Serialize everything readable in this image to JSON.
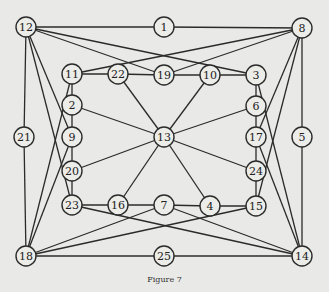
{
  "caption": "Figure 7",
  "nodes": [
    {
      "id": "12",
      "x": 26,
      "y": 27
    },
    {
      "id": "1",
      "x": 164,
      "y": 27
    },
    {
      "id": "8",
      "x": 302,
      "y": 28
    },
    {
      "id": "11",
      "x": 72,
      "y": 74
    },
    {
      "id": "22",
      "x": 118,
      "y": 74
    },
    {
      "id": "19",
      "x": 164,
      "y": 75
    },
    {
      "id": "10",
      "x": 210,
      "y": 75
    },
    {
      "id": "3",
      "x": 256,
      "y": 75
    },
    {
      "id": "2",
      "x": 72,
      "y": 105
    },
    {
      "id": "6",
      "x": 256,
      "y": 106
    },
    {
      "id": "21",
      "x": 24,
      "y": 137
    },
    {
      "id": "9",
      "x": 72,
      "y": 137
    },
    {
      "id": "13",
      "x": 164,
      "y": 137
    },
    {
      "id": "17",
      "x": 256,
      "y": 137
    },
    {
      "id": "5",
      "x": 302,
      "y": 137
    },
    {
      "id": "20",
      "x": 72,
      "y": 171
    },
    {
      "id": "24",
      "x": 256,
      "y": 171
    },
    {
      "id": "23",
      "x": 72,
      "y": 205
    },
    {
      "id": "16",
      "x": 118,
      "y": 205
    },
    {
      "id": "7",
      "x": 164,
      "y": 205
    },
    {
      "id": "4",
      "x": 210,
      "y": 206
    },
    {
      "id": "15",
      "x": 256,
      "y": 206
    },
    {
      "id": "18",
      "x": 26,
      "y": 256
    },
    {
      "id": "25",
      "x": 164,
      "y": 256
    },
    {
      "id": "14",
      "x": 302,
      "y": 256
    }
  ],
  "edges": [
    [
      "12",
      "1"
    ],
    [
      "1",
      "8"
    ],
    [
      "12",
      "21"
    ],
    [
      "21",
      "18"
    ],
    [
      "8",
      "5"
    ],
    [
      "5",
      "14"
    ],
    [
      "18",
      "25"
    ],
    [
      "25",
      "14"
    ],
    [
      "12",
      "3"
    ],
    [
      "12",
      "19"
    ],
    [
      "12",
      "9"
    ],
    [
      "12",
      "23"
    ],
    [
      "8",
      "11"
    ],
    [
      "8",
      "19"
    ],
    [
      "8",
      "17"
    ],
    [
      "8",
      "15"
    ],
    [
      "18",
      "11"
    ],
    [
      "18",
      "9"
    ],
    [
      "18",
      "7"
    ],
    [
      "18",
      "15"
    ],
    [
      "14",
      "3"
    ],
    [
      "14",
      "17"
    ],
    [
      "14",
      "23"
    ],
    [
      "14",
      "7"
    ],
    [
      "11",
      "22"
    ],
    [
      "22",
      "19"
    ],
    [
      "19",
      "10"
    ],
    [
      "10",
      "3"
    ],
    [
      "3",
      "6"
    ],
    [
      "6",
      "17"
    ],
    [
      "17",
      "24"
    ],
    [
      "24",
      "15"
    ],
    [
      "15",
      "4"
    ],
    [
      "4",
      "7"
    ],
    [
      "7",
      "16"
    ],
    [
      "16",
      "23"
    ],
    [
      "23",
      "20"
    ],
    [
      "20",
      "9"
    ],
    [
      "9",
      "2"
    ],
    [
      "2",
      "11"
    ],
    [
      "13",
      "22"
    ],
    [
      "13",
      "10"
    ],
    [
      "13",
      "6"
    ],
    [
      "13",
      "24"
    ],
    [
      "13",
      "4"
    ],
    [
      "13",
      "16"
    ],
    [
      "13",
      "20"
    ],
    [
      "13",
      "2"
    ]
  ]
}
